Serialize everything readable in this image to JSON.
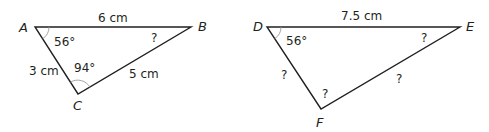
{
  "triangle_abc": {
    "vertices": {
      "A": "A",
      "B": "B",
      "C": "C"
    },
    "sides": {
      "AB": "6 cm",
      "AC": "3 cm",
      "BC": "5 cm"
    },
    "angles": {
      "A": "56°",
      "B": "?",
      "C": "94°"
    }
  },
  "triangle_def": {
    "vertices": {
      "D": "D",
      "E": "E",
      "F": "F"
    },
    "sides": {
      "DE": "7.5 cm",
      "DF": "?",
      "EF": "?"
    },
    "angles": {
      "D": "56°",
      "E": "?",
      "F": "?"
    }
  },
  "colors": {
    "line": "#231f20",
    "arc": "#9a9a9a"
  }
}
